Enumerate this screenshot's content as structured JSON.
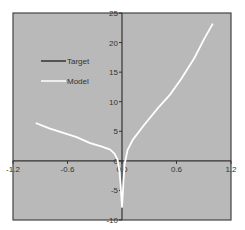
{
  "chart_data": {
    "type": "line",
    "title": "",
    "xlabel": "",
    "ylabel": "",
    "xlim": [
      -1.2,
      1.2
    ],
    "ylim": [
      -10,
      25
    ],
    "x_ticks": [
      -1.2,
      -0.6,
      0.0,
      0.6,
      1.2
    ],
    "x_tick_labels": [
      "-1.2",
      "-0.6",
      "0.0",
      "0.6",
      "1.2"
    ],
    "y_ticks": [
      25,
      20,
      15,
      10,
      5,
      0,
      -5,
      -10
    ],
    "y_tick_labels": [
      "25",
      "20",
      "15",
      "10",
      "5",
      "0",
      "-5",
      "-10"
    ],
    "grid": false,
    "legend_position": "upper-left",
    "background_color": "#b9b9b9",
    "series": [
      {
        "name": "Target",
        "color": "#333333",
        "points": []
      },
      {
        "name": "Model",
        "color": "#ffffff",
        "points": [
          [
            -0.95,
            6.4
          ],
          [
            -0.8,
            5.5
          ],
          [
            -0.68,
            4.9
          ],
          [
            -0.5,
            4.0
          ],
          [
            -0.35,
            3.0
          ],
          [
            -0.22,
            2.4
          ],
          [
            -0.13,
            1.9
          ],
          [
            -0.08,
            1.2
          ],
          [
            -0.05,
            0.2
          ],
          [
            -0.03,
            -1.5
          ],
          [
            -0.015,
            -4.0
          ],
          [
            -0.005,
            -6.5
          ],
          [
            0.0,
            -7.8
          ],
          [
            0.005,
            -6.5
          ],
          [
            0.015,
            -3.5
          ],
          [
            0.03,
            -0.5
          ],
          [
            0.06,
            1.8
          ],
          [
            0.12,
            3.6
          ],
          [
            0.25,
            6.2
          ],
          [
            0.4,
            9.0
          ],
          [
            0.53,
            11.2
          ],
          [
            0.65,
            13.8
          ],
          [
            0.8,
            17.5
          ],
          [
            0.9,
            20.5
          ],
          [
            1.0,
            23.2
          ]
        ]
      }
    ]
  },
  "legend": {
    "items": [
      {
        "label": "Target",
        "color": "#333333"
      },
      {
        "label": "Model",
        "color": "#ffffff"
      }
    ]
  }
}
